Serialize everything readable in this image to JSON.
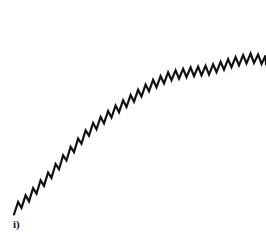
{
  "figure": {
    "panel_label": "i)",
    "line_color": "#111111",
    "background": "#ffffff"
  },
  "chart_data": {
    "type": "line",
    "title": "",
    "xlabel": "",
    "ylabel": "",
    "grid": false,
    "legend": null,
    "trend_points_px": [
      [
        14,
        210
      ],
      [
        30,
        196
      ],
      [
        50,
        175
      ],
      [
        70,
        152
      ],
      [
        90,
        130
      ],
      [
        110,
        114
      ],
      [
        130,
        100
      ],
      [
        150,
        86
      ],
      [
        170,
        76
      ],
      [
        190,
        72
      ],
      [
        210,
        70
      ],
      [
        230,
        63
      ],
      [
        250,
        58
      ],
      [
        266,
        60
      ]
    ],
    "sawtooth": {
      "period_px": 7.5,
      "amplitude_px": 9
    }
  }
}
